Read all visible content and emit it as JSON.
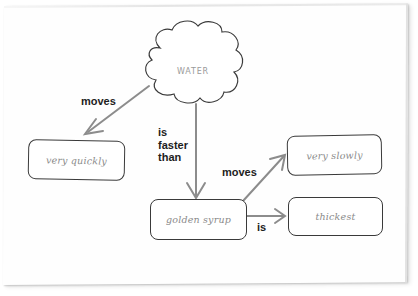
{
  "diagram": {
    "type": "concept-map",
    "colors": {
      "paper": "#fefefe",
      "node_border": "#3a3a3a",
      "node_text": "#8a8a8a",
      "arrow": "#8c8c8c",
      "link_text": "#1d1d1d"
    },
    "nodes": {
      "water": {
        "label": "WATER",
        "shape": "cloud"
      },
      "very_quickly": {
        "label": "very quickly",
        "shape": "rounded-rect"
      },
      "golden_syrup": {
        "label": "golden syrup",
        "shape": "rounded-rect"
      },
      "very_slowly": {
        "label": "very slowly",
        "shape": "rounded-rect"
      },
      "thickest": {
        "label": "thickest",
        "shape": "rounded-rect"
      }
    },
    "links": [
      {
        "from": "water",
        "to": "very_quickly",
        "label": "moves"
      },
      {
        "from": "water",
        "to": "golden_syrup",
        "label_lines": [
          "is",
          "faster",
          "than"
        ]
      },
      {
        "from": "golden_syrup",
        "to": "very_slowly",
        "label": "moves"
      },
      {
        "from": "golden_syrup",
        "to": "thickest",
        "label": "is"
      }
    ]
  }
}
